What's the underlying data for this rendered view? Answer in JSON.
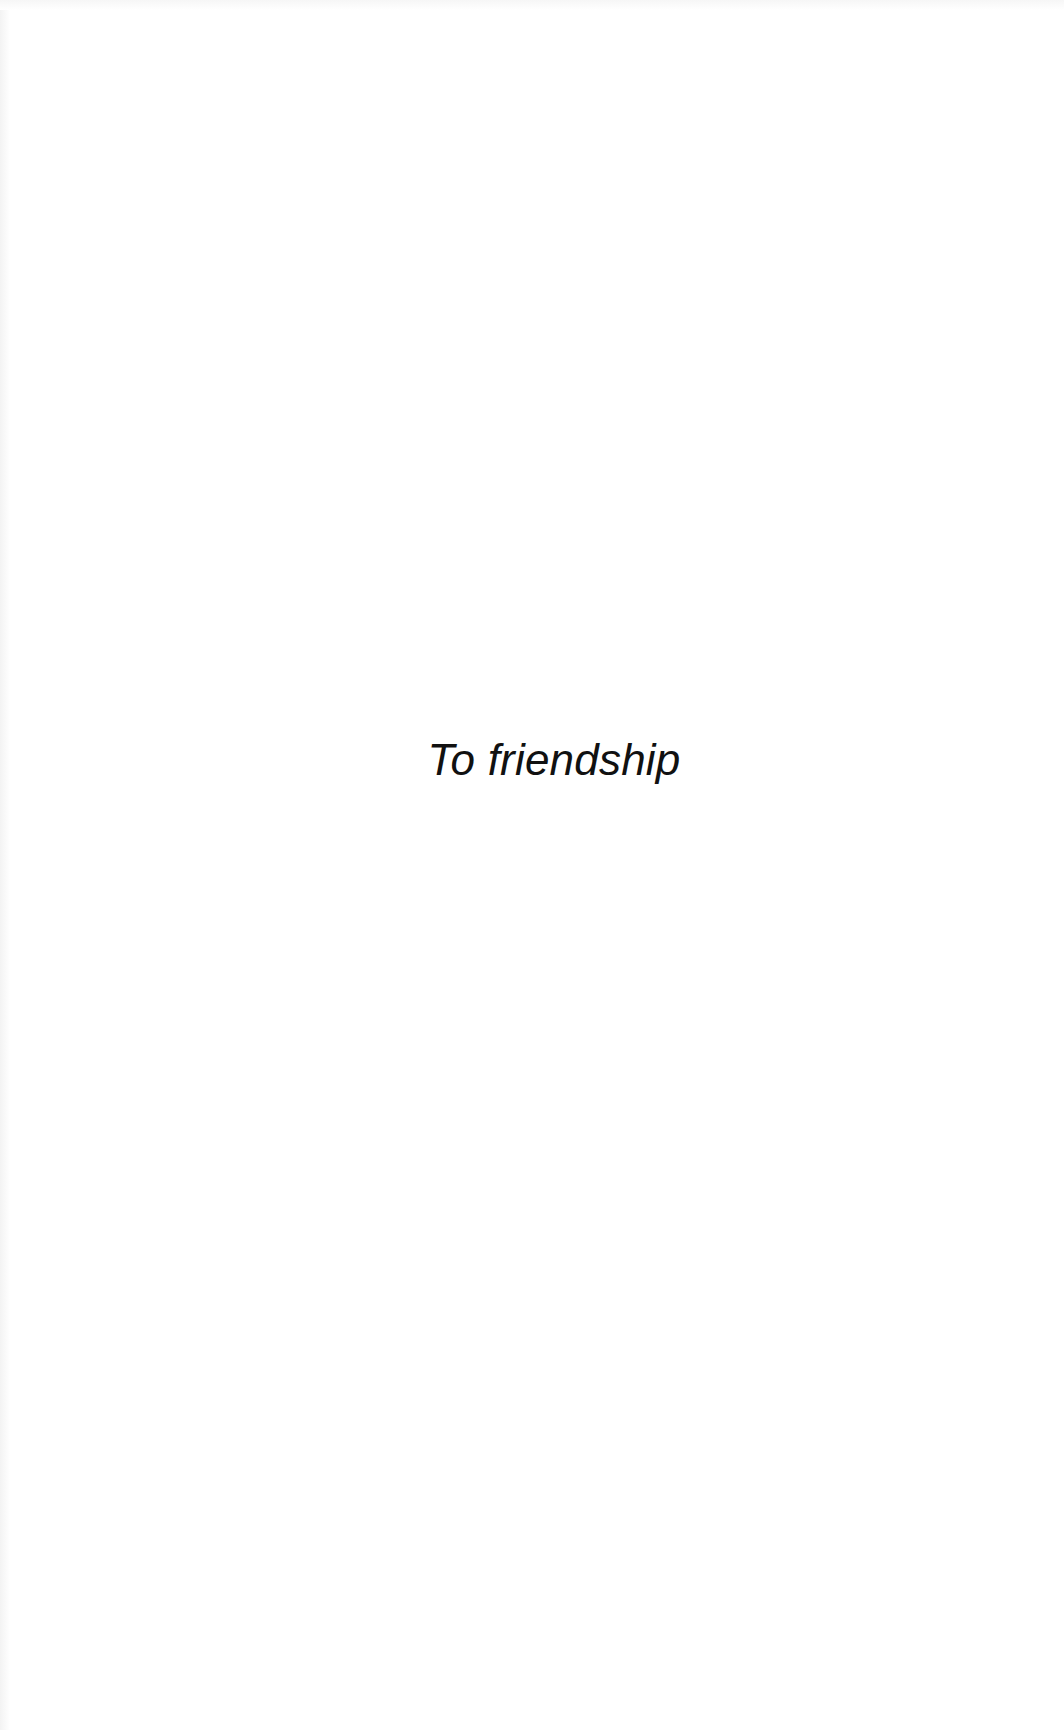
{
  "page": {
    "type": "dedication",
    "dedication_text": "To friendship"
  },
  "colors": {
    "background": "#ffffff",
    "text": "#111111"
  }
}
